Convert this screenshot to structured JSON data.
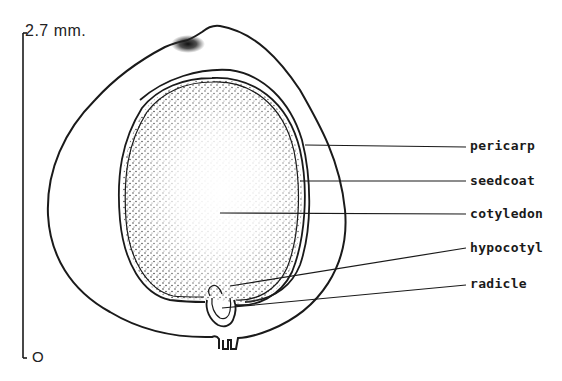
{
  "scale_bar": {
    "top_label": "2.7 mm.",
    "bottom_label": "O"
  },
  "labels": [
    {
      "id": "pericarp",
      "text": "pericarp",
      "y": 145
    },
    {
      "id": "seedcoat",
      "text": "seedcoat",
      "y": 180
    },
    {
      "id": "cotyledon",
      "text": "cotyledon",
      "y": 213
    },
    {
      "id": "hypocotyl",
      "text": "hypocotyl",
      "y": 247
    },
    {
      "id": "radicle",
      "text": "radicle",
      "y": 283
    }
  ],
  "colors": {
    "ink": "#1a1a1a",
    "background": "#ffffff"
  }
}
